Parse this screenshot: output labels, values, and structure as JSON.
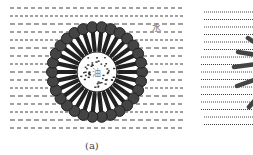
{
  "figure": {
    "panels": [
      {
        "id": "a",
        "caption": "(a)",
        "labels": {
          "water": "水",
          "oil": "油"
        },
        "micelle": {
          "cx": 97,
          "cy": 72,
          "core_r": 20,
          "head_r": 5.5,
          "tail_inner": 22,
          "tail_outer": 43,
          "head_count": 30
        },
        "line_rows": 16,
        "line_style": "dashed"
      },
      {
        "id": "b",
        "caption": "",
        "line_rows": 16,
        "line_style": "dotted",
        "visible": "partial"
      }
    ],
    "colors": {
      "lines": "#444444",
      "molecule": "#444444",
      "molecule_outline": "#222222",
      "core_fill": "#ffffff",
      "oil_dots": "#333333"
    }
  }
}
